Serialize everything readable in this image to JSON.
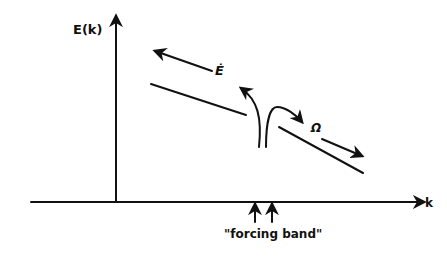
{
  "diagram": {
    "y_axis_label": "E(k)",
    "x_axis_label": "k",
    "forcing_label": "\"forcing band\"",
    "energy_flux_label": "Ė",
    "enstrophy_flux_label": "Ω",
    "colors": {
      "ink": "#111111",
      "background": "#ffffff"
    }
  }
}
